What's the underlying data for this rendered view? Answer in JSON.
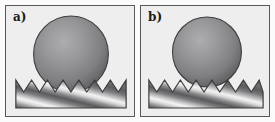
{
  "figure": {
    "width_px": 275,
    "height_px": 122,
    "background_color": "#ffffff",
    "frame_color": "#fbfbfb",
    "panel_background_color": "#eeeeee",
    "panel_border_color": "#58585a"
  },
  "panels": [
    {
      "id": "panel-a",
      "label": "a)",
      "state_name": "wenzel-penetrating",
      "sphere": {
        "name": "droplet-sphere",
        "cx_pct": 51,
        "cy_pct": 45,
        "r_pct": 36,
        "outline_color": "#3c3c3e",
        "highlight_color": "#a9a9ab",
        "mid_color": "#8a8a8c",
        "edge_color": "#5e5e61",
        "highlight_x_pct": 40,
        "highlight_y_pct": 36
      },
      "surface": {
        "name": "sawtooth-substrate",
        "teeth_count": 6,
        "tooth_peak_y_pct": 68,
        "tooth_valley_y_pct": 80,
        "base_bottom_y_pct": 94,
        "left_x_pct": 8,
        "right_x_pct": 94,
        "outline_color": "#3c3c3e",
        "stripe_light_color": "#f2f2f2",
        "stripe_dark_color": "#4a4a4c",
        "stripe_angle_deg": 55
      }
    },
    {
      "id": "panel-b",
      "label": "b)",
      "state_name": "cassie-suspended",
      "sphere": {
        "name": "droplet-sphere",
        "cx_pct": 51,
        "cy_pct": 42,
        "r_pct": 33,
        "outline_color": "#3c3c3e",
        "highlight_color": "#a9a9ab",
        "mid_color": "#8a8a8c",
        "edge_color": "#5e5e61",
        "highlight_x_pct": 40,
        "highlight_y_pct": 34
      },
      "surface": {
        "name": "sawtooth-substrate",
        "teeth_count": 6,
        "tooth_peak_y_pct": 68,
        "tooth_valley_y_pct": 80,
        "base_bottom_y_pct": 94,
        "left_x_pct": 6,
        "right_x_pct": 96,
        "outline_color": "#3c3c3e",
        "stripe_light_color": "#f2f2f2",
        "stripe_dark_color": "#4a4a4c",
        "stripe_angle_deg": 55
      }
    }
  ]
}
